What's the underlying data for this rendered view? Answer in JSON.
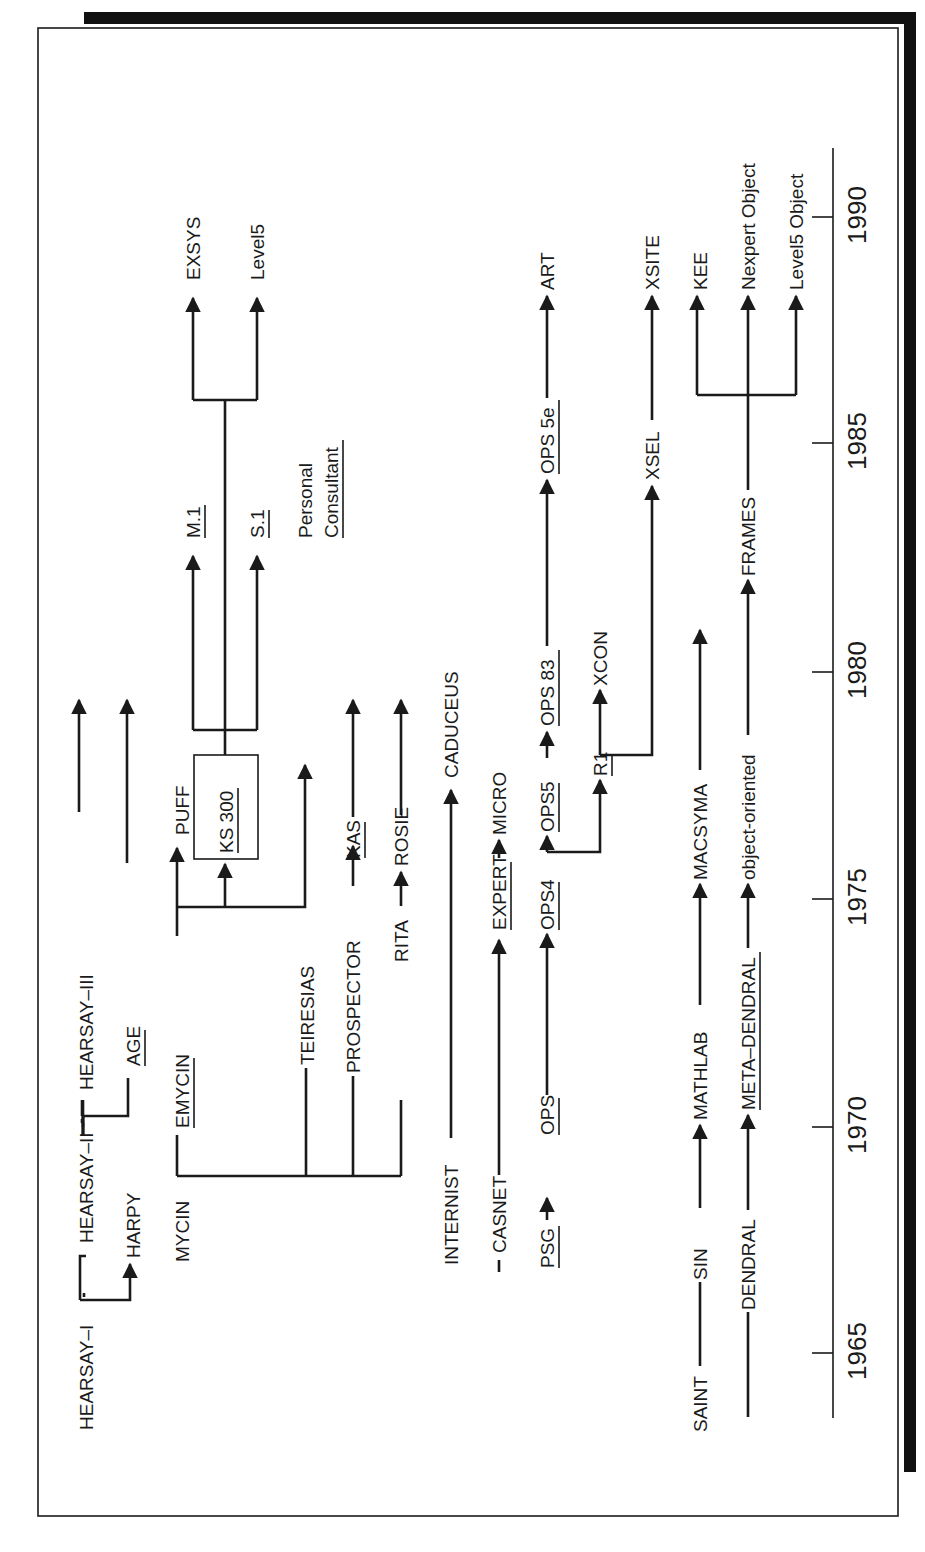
{
  "axis": {
    "label": "year",
    "ticks": [
      {
        "year": "1965",
        "y": 1353
      },
      {
        "year": "1970",
        "y": 1127
      },
      {
        "year": "1975",
        "y": 899
      },
      {
        "year": "1980",
        "y": 672
      },
      {
        "year": "1985",
        "y": 443
      },
      {
        "year": "1990",
        "y": 217
      }
    ],
    "x": 833,
    "y_start": 1418,
    "y_end": 148
  },
  "colors": {
    "ink": "#1a1a1a",
    "background": "#ffffff",
    "shadow": "#111111"
  },
  "nodes": [
    {
      "id": "hearsay1",
      "label": "HEARSAY–I",
      "x": 86,
      "y": 1430,
      "underline": false
    },
    {
      "id": "hearsay2",
      "label": "HEARSAY–II",
      "x": 86,
      "y": 1243,
      "underline": false
    },
    {
      "id": "hearsay3",
      "label": "HEARSAY–III",
      "x": 86,
      "y": 940,
      "underline": false
    },
    {
      "id": "harpy",
      "label": "HARPY",
      "x": 133,
      "y": 1208,
      "underline": false
    },
    {
      "id": "age",
      "label": "AGE",
      "x": 133,
      "y": 922,
      "underline": true
    },
    {
      "id": "mycin",
      "label": "MYCIN",
      "x": 182,
      "y": 1262,
      "underline": false
    },
    {
      "id": "emycin",
      "label": "EMYCIN",
      "x": 182,
      "y": 963,
      "underline": true
    },
    {
      "id": "puff",
      "label": "PUFF",
      "x": 182,
      "y": 835,
      "underline": false
    },
    {
      "id": "ks300",
      "label": "KS 300",
      "x": 229,
      "y": 855,
      "underline": true
    },
    {
      "id": "m1",
      "label": "M.1",
      "x": 190,
      "y": 538,
      "underline": true
    },
    {
      "id": "s1",
      "label": "S.1",
      "x": 256,
      "y": 538,
      "underline": true
    },
    {
      "id": "pc1",
      "label": "Personal",
      "x": 306,
      "y": 538,
      "underline": false
    },
    {
      "id": "pc2",
      "label": "Consultant",
      "x": 336,
      "y": 538,
      "underline": true
    },
    {
      "id": "exsys",
      "label": "EXSYS",
      "x": 190,
      "y": 280,
      "underline": false
    },
    {
      "id": "level5",
      "label": "Level5",
      "x": 256,
      "y": 280,
      "underline": false
    },
    {
      "id": "teiresias",
      "label": "TEIRESIAS",
      "x": 307,
      "y": 1053,
      "underline": false
    },
    {
      "id": "prospector",
      "label": "PROSPECTOR",
      "x": 353,
      "y": 1065,
      "underline": false
    },
    {
      "id": "kas",
      "label": "KAS",
      "x": 353,
      "y": 868,
      "underline": true
    },
    {
      "id": "rita",
      "label": "RITA",
      "x": 401,
      "y": 954,
      "underline": false
    },
    {
      "id": "rosie",
      "label": "ROSIE",
      "x": 401,
      "y": 859,
      "underline": false
    },
    {
      "id": "internist",
      "label": "INTERNIST",
      "x": 451,
      "y": 1265,
      "underline": false
    },
    {
      "id": "caduceus",
      "label": "CADUCEUS",
      "x": 451,
      "y": 780,
      "underline": false
    },
    {
      "id": "casnet",
      "label": "CASNET",
      "x": 499,
      "y": 1241,
      "underline": false
    },
    {
      "id": "expert",
      "label": "EXPERT",
      "x": 499,
      "y": 925,
      "underline": true
    },
    {
      "id": "micro",
      "label": "MICRO",
      "x": 499,
      "y": 830,
      "underline": false
    },
    {
      "id": "psg",
      "label": "PSG",
      "x": 547,
      "y": 1265,
      "underline": true
    },
    {
      "id": "ops",
      "label": "OPS",
      "x": 547,
      "y": 1123,
      "underline": true
    },
    {
      "id": "ops4",
      "label": "OPS4",
      "x": 547,
      "y": 921,
      "underline": true
    },
    {
      "id": "ops5",
      "label": "OPS5",
      "x": 547,
      "y": 825,
      "underline": true
    },
    {
      "id": "ops83",
      "label": "OPS 83",
      "x": 547,
      "y": 718,
      "underline": true
    },
    {
      "id": "ops5e",
      "label": "OPS 5e",
      "x": 547,
      "y": 467,
      "underline": true
    },
    {
      "id": "art",
      "label": "ART",
      "x": 547,
      "y": 280,
      "underline": false
    },
    {
      "id": "r1",
      "label": "R1",
      "x": 600,
      "y": 753,
      "underline": true
    },
    {
      "id": "xcon",
      "label": "XCON",
      "x": 600,
      "y": 680,
      "underline": false
    },
    {
      "id": "xsel",
      "label": "XSEL",
      "x": 652,
      "y": 473,
      "underline": false
    },
    {
      "id": "xsite",
      "label": "XSITE",
      "x": 652,
      "y": 280,
      "underline": false
    },
    {
      "id": "saint",
      "label": "SAINT",
      "x": 700,
      "y": 1432,
      "underline": false
    },
    {
      "id": "sin",
      "label": "SIN",
      "x": 700,
      "y": 1240,
      "underline": false
    },
    {
      "id": "mathlab",
      "label": "MATHLAB",
      "x": 700,
      "y": 1105,
      "underline": false
    },
    {
      "id": "macsyma",
      "label": "MACSYMA",
      "x": 700,
      "y": 870,
      "underline": false
    },
    {
      "id": "dendral",
      "label": "DENDRAL",
      "x": 748,
      "y": 1298,
      "underline": false
    },
    {
      "id": "metadendral",
      "label": "META–DENDRAL",
      "x": 748,
      "y": 1100,
      "underline": true
    },
    {
      "id": "objor",
      "label": "object-oriented",
      "x": 748,
      "y": 868,
      "underline": false
    },
    {
      "id": "frames",
      "label": "FRAMES",
      "x": 748,
      "y": 567,
      "underline": false
    },
    {
      "id": "kee",
      "label": "KEE",
      "x": 700,
      "y": 280,
      "underline": false
    },
    {
      "id": "nexpert",
      "label": "Nexpert Object",
      "x": 748,
      "y": 280,
      "underline": false
    },
    {
      "id": "level5obj",
      "label": "Level5 Object",
      "x": 796,
      "y": 280,
      "underline": false
    }
  ]
}
